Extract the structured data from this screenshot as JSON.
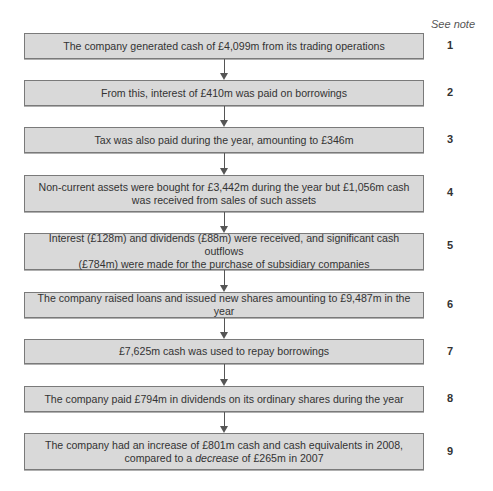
{
  "header": {
    "see_note_label": "See note"
  },
  "steps": [
    {
      "note": "1",
      "text": "The company generated cash of £4,099m from its trading operations"
    },
    {
      "note": "2",
      "text": "From this, interest of £410m was paid on borrowings"
    },
    {
      "note": "3",
      "text": "Tax was also paid during the year, amounting to £346m"
    },
    {
      "note": "4",
      "text_line1": "Non-current assets were bought for £3,442m during the year but £1,056m cash",
      "text_line2": "was received from sales of such assets"
    },
    {
      "note": "5",
      "text_line1": "Interest (£128m) and dividends (£88m) were received, and significant cash outflows",
      "text_line2": "(£784m) were made for the purchase of subsidiary companies"
    },
    {
      "note": "6",
      "text": "The company raised loans and issued new shares amounting to £9,487m in the year"
    },
    {
      "note": "7",
      "text": "£7,625m cash was used to repay borrowings"
    },
    {
      "note": "8",
      "text": "The company paid £794m in dividends on its ordinary shares during the year"
    },
    {
      "note": "9",
      "text_line1": "The company had an increase of £801m cash and cash equivalents in 2008,",
      "text_line2_pre": "compared to a ",
      "text_line2_em": "decrease",
      "text_line2_post": " of £265m in 2007"
    }
  ],
  "colors": {
    "box_fill": "#d9d9d9",
    "box_border": "#7a7a7a",
    "text": "#333333",
    "arrow": "#555555"
  }
}
